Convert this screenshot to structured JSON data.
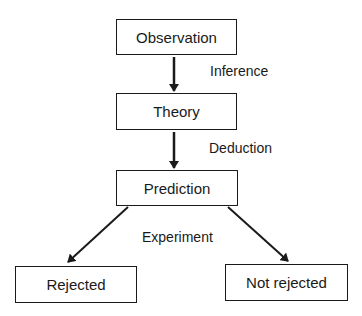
{
  "diagram": {
    "nodes": {
      "observation": "Observation",
      "theory": "Theory",
      "prediction": "Prediction",
      "rejected": "Rejected",
      "not_rejected": "Not rejected"
    },
    "edge_labels": {
      "inference": "Inference",
      "deduction": "Deduction",
      "experiment": "Experiment"
    },
    "edges": [
      {
        "from": "observation",
        "to": "theory",
        "label": "Inference"
      },
      {
        "from": "theory",
        "to": "prediction",
        "label": "Deduction"
      },
      {
        "from": "prediction",
        "to": "rejected",
        "label": "Experiment"
      },
      {
        "from": "prediction",
        "to": "not_rejected",
        "label": "Experiment"
      }
    ]
  }
}
